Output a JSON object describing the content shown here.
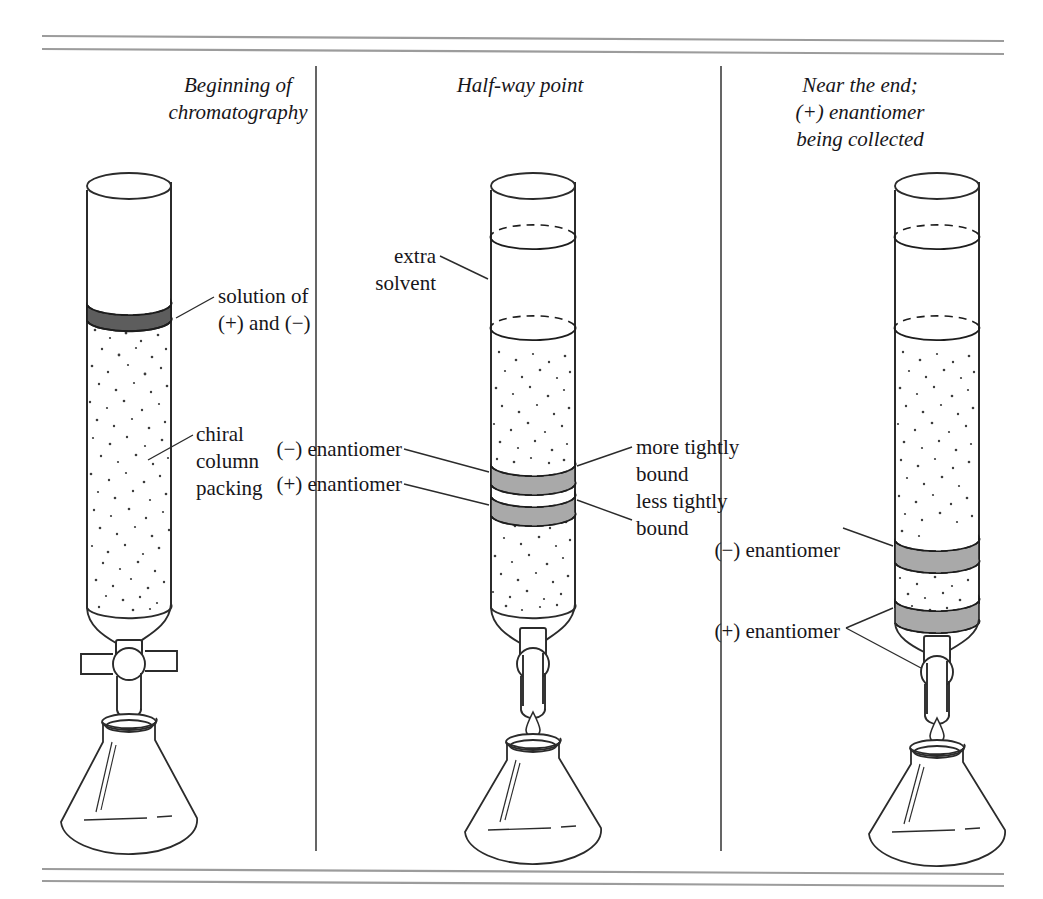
{
  "figure": {
    "title_panels": [
      {
        "name": "panel-1",
        "text": "Beginning of\nchromatography"
      },
      {
        "name": "panel-2",
        "text": "Half-way point"
      },
      {
        "name": "panel-3",
        "text": "Near the end;\n(+) enantiomer\nbeing collected"
      }
    ],
    "labels": {
      "solution_of": "solution of\n(+) and (−)",
      "chiral_packing": "chiral\ncolumn\npacking",
      "extra_solvent": "extra\nsolvent",
      "minus_enantiomer_mid": "(−) enantiomer",
      "plus_enantiomer_mid": "(+) enantiomer",
      "more_tightly_bound": "more tightly\nbound",
      "less_tightly_bound": "less tightly\nbound",
      "minus_enantiomer_right": "(−) enantiomer",
      "plus_enantiomer_right": "(+) enantiomer"
    },
    "colors": {
      "ink": "#17161a",
      "rule": "#9a9a9a",
      "divider": "#4a4a4a",
      "dark_band": "#5a5a5a",
      "gray_band": "#a9a9a9",
      "speckle": "#3c3c3c",
      "glass": "#2b2b2b",
      "background": "#ffffff"
    },
    "rules": {
      "top": [
        "rule-top-1",
        "rule-top-2"
      ],
      "bottom": [
        "rule-bottom-1",
        "rule-bottom-2"
      ]
    },
    "dividers": [
      "divider-left",
      "divider-right"
    ]
  }
}
